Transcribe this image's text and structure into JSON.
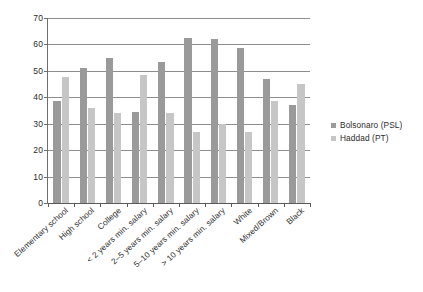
{
  "chart_data": {
    "type": "bar",
    "title": "",
    "subtitle": "",
    "xlabel": "",
    "ylabel": "",
    "ylim": [
      0,
      70
    ],
    "yticks": [
      0,
      10,
      20,
      30,
      40,
      50,
      60,
      70
    ],
    "grid": true,
    "legend_position": "right",
    "categories": [
      "Elementary school",
      "High school",
      "College",
      "< 2 years min. salary",
      "2–5 years min. salary",
      "5–10 years min. salary",
      "> 10 years min. salary",
      "White",
      "Mixed/Brown",
      "Black"
    ],
    "series": [
      {
        "name": "Bolsonaro (PSL)",
        "color": "#9a9a9a",
        "values": [
          38.5,
          51,
          55,
          34.5,
          53.5,
          62.5,
          62,
          58.5,
          47,
          37
        ]
      },
      {
        "name": "Haddad (PT)",
        "color": "#c6c6c6",
        "values": [
          47.5,
          36,
          34,
          48.5,
          34,
          27,
          30,
          27,
          38.5,
          45
        ]
      }
    ]
  },
  "legend": {
    "items": [
      {
        "label": "Bolsonaro (PSL)"
      },
      {
        "label": "Haddad (PT)"
      }
    ]
  }
}
